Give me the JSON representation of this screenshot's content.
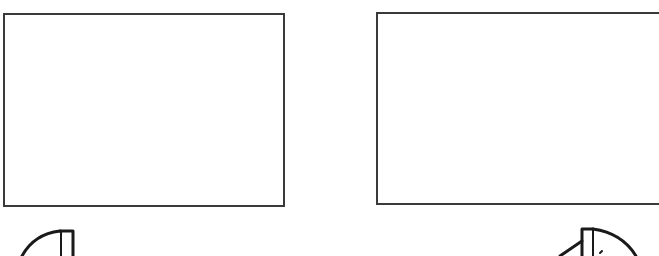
{
  "diagram": {
    "panels": [
      {
        "id": "left",
        "label": ""
      },
      {
        "id": "right",
        "label": ""
      }
    ],
    "shapes": [
      {
        "name": "partial-fan-shape-left",
        "description": "quarter-arc shape with vertical bar, bottom-left"
      },
      {
        "name": "partial-fan-shape-right",
        "description": "quarter-arc shape with vertical bar and angled line, bottom-right"
      }
    ],
    "stroke_color": "#1a1a1a",
    "frame_color": "#3a3a3a",
    "background": "#ffffff"
  }
}
